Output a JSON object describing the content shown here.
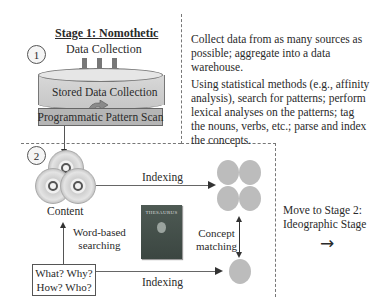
{
  "stage1": {
    "title": "Stage 1: Nomothetic",
    "number": "1",
    "data_collection_label": "Data Collection",
    "stored_label": "Stored Data Collection",
    "scan_label": "Programmatic Pattern Scan",
    "description_1": "Collect data from as many sources as possible; aggregate into a data warehouse.",
    "description_2": "Using statistical methods (e.g., affinity analysis), search for patterns; perform lexical analyses on the patterns; tag the nouns, verbs, etc.; parse and index the concepts."
  },
  "stage2": {
    "number": "2",
    "content_label": "Content",
    "indexing_top_label": "Indexing",
    "indexing_bottom_label": "Indexing",
    "word_search_label_1": "Word-based",
    "word_search_label_2": "searching",
    "concept_label_1": "Concept",
    "concept_label_2": "matching",
    "question_line_1": "What? Why?",
    "question_line_2": "How? Who?",
    "book_title": "THESAURUS"
  },
  "next": {
    "line_1": "Move to Stage 2:",
    "line_2": "Ideographic Stage",
    "arrow": "→"
  }
}
